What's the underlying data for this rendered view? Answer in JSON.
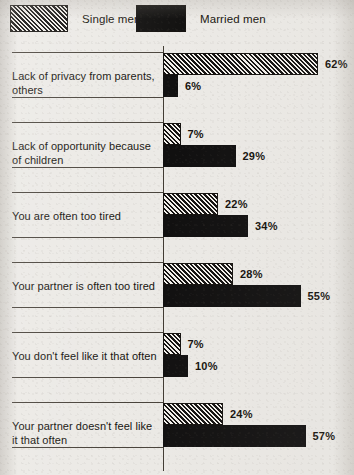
{
  "legend": {
    "entries": [
      {
        "label": "Single men",
        "swatch": "hatched-swatch-icon"
      },
      {
        "label": "Married men",
        "swatch": "solid-swatch-icon"
      }
    ]
  },
  "chart_data": {
    "type": "bar",
    "orientation": "horizontal",
    "title": "",
    "xlabel": "",
    "ylabel": "",
    "xlim": [
      0,
      62
    ],
    "grid": false,
    "legend_position": "top-left",
    "value_suffix": "%",
    "categories": [
      "Lack of privacy from parents, others",
      "Lack of opportunity because of children",
      "You are often too tired",
      "Your partner is often too tired",
      "You don't feel like it that often",
      "Your partner doesn't feel like it that often"
    ],
    "series": [
      {
        "name": "Single men",
        "values": [
          62,
          7,
          22,
          28,
          7,
          24
        ]
      },
      {
        "name": "Married men",
        "values": [
          6,
          29,
          34,
          55,
          10,
          57
        ]
      }
    ],
    "labels": {
      "single": [
        "62%",
        "7%",
        "22%",
        "28%",
        "7%",
        "24%"
      ],
      "married": [
        "6%",
        "29%",
        "34%",
        "55%",
        "10%",
        "57%"
      ]
    }
  },
  "colors": {
    "ink": "#121110",
    "paper": "#eceae6",
    "rule": "#4a443c"
  }
}
